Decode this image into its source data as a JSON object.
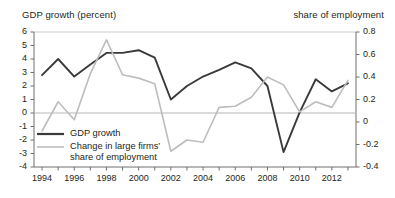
{
  "chart_data": {
    "type": "line",
    "title": "",
    "xlabel": "",
    "ylabel": "GDP growth (percent)",
    "y2label": "share of employment",
    "grid": false,
    "legend_position": "inside-lower-left",
    "x": [
      1994,
      1995,
      1996,
      1997,
      1998,
      1999,
      2000,
      2001,
      2002,
      2003,
      2004,
      2005,
      2006,
      2007,
      2008,
      2009,
      2010,
      2011,
      2012,
      2013
    ],
    "xlim": [
      1993.5,
      2013.5
    ],
    "xticks": [
      1994,
      1995,
      1996,
      1997,
      1998,
      1999,
      2000,
      2001,
      2002,
      2003,
      2004,
      2005,
      2006,
      2007,
      2008,
      2009,
      2010,
      2011,
      2012,
      2013
    ],
    "xticklabels": [
      "1994",
      "",
      "1996",
      "",
      "1998",
      "",
      "2000",
      "",
      "2002",
      "",
      "2004",
      "",
      "2006",
      "",
      "2008",
      "",
      "2010",
      "",
      "2012",
      ""
    ],
    "ylim": [
      -4,
      6
    ],
    "yticks": [
      -4,
      -3,
      -2,
      -1,
      0,
      1,
      2,
      3,
      4,
      5,
      6
    ],
    "yticklabels": [
      "-4",
      "-3",
      "-2",
      "-1",
      "0",
      "1",
      "2",
      "3",
      "4",
      "5",
      "6"
    ],
    "y2lim": [
      -0.4,
      0.8
    ],
    "y2ticks": [
      -0.4,
      -0.2,
      0,
      0.2,
      0.4,
      0.6,
      0.8
    ],
    "y2ticklabels": [
      "-0.4",
      "-0.2",
      "0",
      "0.2",
      "0.4",
      "0.6",
      "0.8"
    ],
    "series": [
      {
        "name": "GDP growth",
        "axis": "left",
        "color": "#3a3a3a",
        "width": 1.9,
        "values": [
          2.8,
          4.0,
          2.7,
          3.6,
          4.45,
          4.45,
          4.65,
          4.1,
          1.0,
          2.0,
          2.7,
          3.2,
          3.75,
          3.3,
          2.0,
          -2.9,
          0.05,
          2.5,
          1.6,
          2.2
        ]
      },
      {
        "name": "Change in large firms' share of employment",
        "axis": "right",
        "color": "#bdbdbd",
        "width": 1.6,
        "values": [
          -0.08,
          0.18,
          0.02,
          0.43,
          0.73,
          0.42,
          0.39,
          0.34,
          -0.26,
          -0.16,
          -0.18,
          0.13,
          0.14,
          0.22,
          0.4,
          0.33,
          0.09,
          0.18,
          0.13,
          0.37
        ]
      }
    ],
    "legend": [
      {
        "label": "GDP growth",
        "color": "#3a3a3a"
      },
      {
        "label": "Change in large firms’\nshare of employment",
        "color": "#bdbdbd"
      }
    ]
  },
  "axis_titles": {
    "left": "GDP growth (percent)",
    "right": "share of employment"
  }
}
